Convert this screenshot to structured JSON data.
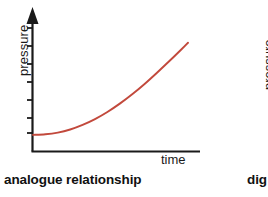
{
  "figure": {
    "panels": [
      {
        "id": "analogue",
        "caption": "analogue relationship",
        "y_axis_label": "pressure",
        "x_axis_label": "time",
        "curve_color": "#c2493c",
        "axis_color": "#1a1a1a"
      },
      {
        "id": "digital",
        "caption": "dig",
        "y_axis_label": "pressure"
      }
    ]
  },
  "chart_data": {
    "type": "line",
    "title": "analogue relationship",
    "xlabel": "time",
    "ylabel": "pressure",
    "grid": false,
    "legend": null,
    "xlim": [
      0,
      1
    ],
    "ylim": [
      0,
      1
    ],
    "axis_ticks": {
      "x": [],
      "y": [
        "",
        "",
        "",
        "",
        "",
        "",
        ""
      ]
    },
    "series": [
      {
        "name": "pressure",
        "color": "#c2493c",
        "x": [
          0.0,
          0.08,
          0.16,
          0.24,
          0.32,
          0.4,
          0.48,
          0.56,
          0.64,
          0.72,
          0.8,
          0.88,
          0.96,
          1.0
        ],
        "y": [
          0.145,
          0.15,
          0.165,
          0.192,
          0.232,
          0.283,
          0.345,
          0.418,
          0.5,
          0.59,
          0.688,
          0.79,
          0.895,
          0.95
        ]
      }
    ]
  }
}
